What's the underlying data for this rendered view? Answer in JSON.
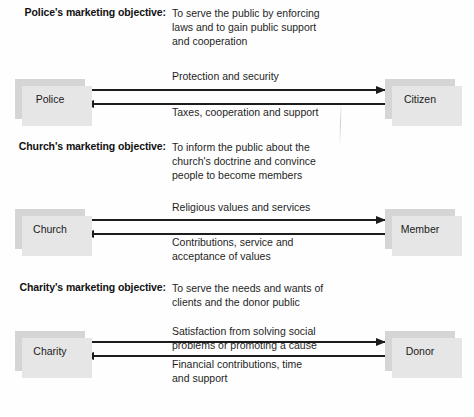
{
  "diagram": {
    "sections": [
      {
        "id": "police",
        "objective_label": "Police's marketing objective:",
        "objective_lines": [
          "To serve the public by enforcing",
          "laws and to gain public support",
          "and cooperation"
        ],
        "left_node": "Police",
        "right_node": "Citizen",
        "outbound_lines": [
          "Protection and security"
        ],
        "inbound_lines": [
          "Taxes, cooperation and support"
        ]
      },
      {
        "id": "church",
        "objective_label": "Church's marketing objective:",
        "objective_lines": [
          "To inform the public about the",
          "church's doctrine and convince",
          "people to become members"
        ],
        "left_node": "Church",
        "right_node": "Member",
        "outbound_lines": [
          "Religious values and services"
        ],
        "inbound_lines": [
          "Contributions, service and",
          "acceptance of values"
        ]
      },
      {
        "id": "charity",
        "objective_label": "Charity's marketing objective:",
        "objective_lines": [
          "To serve the needs and wants of",
          "clients and the donor public"
        ],
        "left_node": "Charity",
        "right_node": "Donor",
        "outbound_lines": [
          "Satisfaction from solving social",
          "problems or promoting a cause"
        ],
        "inbound_lines": [
          "Financial contributions, time",
          "and support"
        ]
      }
    ],
    "colors": {
      "node_fill": "#d5d5d5",
      "node_shadow": "#e6e6e6",
      "arrow": "#1c1c1c",
      "text": "#1f1f1f",
      "background": "#fefefe"
    }
  }
}
